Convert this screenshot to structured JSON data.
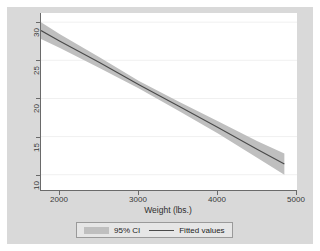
{
  "chart_data": {
    "type": "line",
    "title": "",
    "subtitle": "",
    "xlabel": "Weight (lbs.)",
    "ylabel": "",
    "xlim": [
      1760,
      5000
    ],
    "ylim": [
      8.0,
      31.2
    ],
    "xticks": [
      2000,
      3000,
      4000,
      5000
    ],
    "xtick_labels": [
      "2000",
      "3000",
      "4000",
      "5000"
    ],
    "yticks": [
      10,
      15,
      20,
      25,
      30
    ],
    "ytick_labels": [
      "10",
      "15",
      "20",
      "25",
      "30"
    ],
    "grid": "horizontal",
    "legend_position": "bottom",
    "series": [
      {
        "name": "Fitted values",
        "type": "line",
        "color": "#4a4a4a",
        "x": [
          1760,
          2000,
          2500,
          3000,
          3500,
          4000,
          4500,
          4840
        ],
        "values": [
          28.9,
          27.5,
          24.7,
          21.8,
          19.0,
          16.2,
          13.3,
          11.4
        ]
      },
      {
        "name": "95% CI",
        "type": "area",
        "color": "#bfbfbf",
        "x": [
          1760,
          2000,
          2500,
          3000,
          3500,
          4000,
          4500,
          4840
        ],
        "lower": [
          27.8,
          26.6,
          24.0,
          21.3,
          18.4,
          15.4,
          12.2,
          10.0
        ],
        "upper": [
          30.0,
          28.4,
          25.4,
          22.3,
          19.6,
          17.0,
          14.4,
          12.8
        ]
      }
    ],
    "annotations": []
  },
  "legend": {
    "items": [
      {
        "label": "95% CI",
        "marker": "band-swatch",
        "color": "#bfbfbf"
      },
      {
        "label": "Fitted values",
        "marker": "line-swatch",
        "color": "#4a4a4a"
      }
    ]
  },
  "colors": {
    "graph_background": "#d9d9d9",
    "plot_background": "#ffffff",
    "axis": "#6a6a6a",
    "gridline": "#f0f0f0",
    "ci_band": "#bfbfbf",
    "fit_line": "#4a4a4a",
    "legend_background": "#e6e6e6",
    "legend_border": "#9a9a9a",
    "tick_text": "#3a3a3a"
  }
}
